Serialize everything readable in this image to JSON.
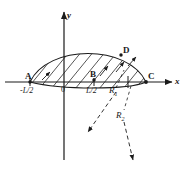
{
  "figure": {
    "axes": {
      "x_label": "x",
      "y_label": "y",
      "origin_label": "0"
    },
    "points": [
      {
        "id": "A",
        "label": "A",
        "x": 30,
        "y": 82
      },
      {
        "id": "B",
        "label": "B",
        "x": 94,
        "y": 80
      },
      {
        "id": "C",
        "label": "C",
        "x": 146,
        "y": 82
      },
      {
        "id": "D",
        "label": "D",
        "x": 118,
        "y": 54
      }
    ],
    "tick_labels": [
      {
        "id": "neg-half-L",
        "label": "-L/2",
        "x": 22,
        "y": 88
      },
      {
        "id": "pos-half-L",
        "label": "L/2",
        "x": 88,
        "y": 88
      }
    ],
    "radius_labels": [
      {
        "id": "R1",
        "base": "R",
        "sub": "1",
        "x": 111,
        "y": 87
      },
      {
        "id": "R2",
        "base": "R",
        "sub": "2",
        "x": 118,
        "y": 112
      }
    ],
    "colors": {
      "ink": "#1a1a1a",
      "hatch": "#2b2b2b",
      "background": "#ffffff"
    },
    "geometry": {
      "upper_arc": "A-D-C large circular arc (radius R2)",
      "lower_arc": "A-B-C shallow circular arc (radius R1)",
      "hatched_region": "between upper arc and lower arc",
      "hatch_direction": "diagonal, lower-left to upper-right",
      "hatch_count": 11
    },
    "leaders": [
      {
        "id": "leader-R1",
        "from": "R1 label",
        "direction": "down-left",
        "dashed": true
      },
      {
        "id": "leader-R2",
        "from": "R2 label",
        "direction": "down",
        "dashed": true
      }
    ]
  }
}
